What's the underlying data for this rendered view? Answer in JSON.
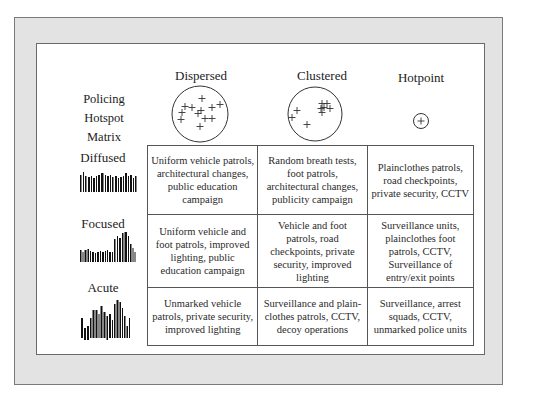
{
  "matrix_title": [
    "Policing",
    "Hotspot",
    "Matrix"
  ],
  "columns": [
    {
      "label": "Dispersed",
      "icon": "dispersed-points-circle-icon"
    },
    {
      "label": "Clustered",
      "icon": "clustered-points-circle-icon"
    },
    {
      "label": "Hotpoint",
      "icon": "single-point-circle-icon"
    }
  ],
  "rows": [
    {
      "label": "Diffused",
      "icon": "diffused-bar-pattern-icon",
      "cells": [
        "Uniform vehicle patrols, architectural changes, public education campaign",
        "Random breath tests, foot patrols, architectural changes, publicity campaign",
        "Plainclothes patrols, road checkpoints, private security, CCTV"
      ]
    },
    {
      "label": "Focused",
      "icon": "focused-bar-pattern-icon",
      "cells": [
        "Uniform vehicle and foot patrols, improved lighting, public education campaign",
        "Vehicle and foot patrols, road checkpoints, private security, improved lighting",
        "Surveillance units, plainclothes foot patrols, CCTV, Surveillance of entry/exit points"
      ]
    },
    {
      "label": "Acute",
      "icon": "acute-bar-pattern-icon",
      "cells": [
        "Unmarked vehicle patrols, private security, improved lighting",
        "Surveillance and plain-clothes patrols, CCTV, decoy operations",
        "Surveillance, arrest squads, CCTV, unmarked police units"
      ]
    }
  ],
  "colors": {
    "frame": "#e3e3e3",
    "panel": "#ffffff",
    "ink": "#222222",
    "border": "#555555"
  }
}
